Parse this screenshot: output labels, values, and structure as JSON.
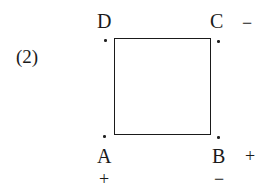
{
  "figure": {
    "number_label": "(2)",
    "vertices": {
      "A": {
        "label": "A",
        "sign": "+"
      },
      "B": {
        "label": "B",
        "sign_right": "+",
        "sign_below": "−"
      },
      "C": {
        "label": "C",
        "sign": "−"
      },
      "D": {
        "label": "D"
      }
    },
    "shape": "square"
  }
}
